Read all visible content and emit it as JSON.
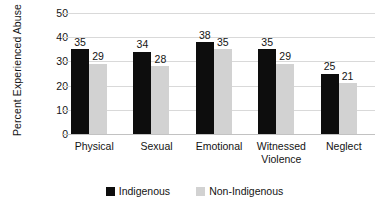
{
  "chart_data": {
    "type": "bar",
    "title": "",
    "xlabel": "",
    "ylabel": "Percent Experienced Abuse",
    "ylim": [
      0,
      50
    ],
    "ytick_labels": [
      "50",
      "40",
      "30",
      "20",
      "10",
      "0"
    ],
    "ytick_values": [
      50,
      40,
      30,
      20,
      10,
      0
    ],
    "grid": true,
    "legend_position": "bottom-center",
    "categories": [
      "Physical",
      "Sexual",
      "Emotional",
      "Witnessed Violence",
      "Neglect"
    ],
    "category_lines": [
      [
        "Physical"
      ],
      [
        "Sexual"
      ],
      [
        "Emotional"
      ],
      [
        "Witnessed",
        "Violence"
      ],
      [
        "Neglect"
      ]
    ],
    "series": [
      {
        "name": "Indigenous",
        "color": "#0d0d0d",
        "values": [
          35,
          34,
          38,
          35,
          25
        ],
        "labels": [
          "35",
          "34",
          "38",
          "35",
          "25"
        ]
      },
      {
        "name": "Non-Indigenous",
        "color": "#d2d2d2",
        "values": [
          29,
          28,
          35,
          29,
          21
        ],
        "labels": [
          "29",
          "28",
          "35",
          "29",
          "21"
        ]
      }
    ]
  }
}
